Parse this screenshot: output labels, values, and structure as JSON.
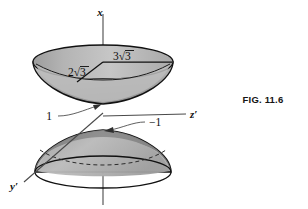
{
  "figure": {
    "caption": "FIG. 11.6",
    "axes": {
      "x_label": "x",
      "z_prime_label": "z′",
      "y_prime_label": "y′"
    },
    "measurements": {
      "upper_minor_radius": {
        "coefficient": "2",
        "radical": "√",
        "radicand": "3"
      },
      "upper_major_radius": {
        "coefficient": "3",
        "radical": "√",
        "radicand": "3"
      }
    },
    "vertex_labels": {
      "upper_cone_vertex": "1",
      "lower_cone_vertex": "−1"
    },
    "colors": {
      "surface_fill": "#b3b3b3",
      "surface_fill_light": "#c8c8c8",
      "surface_fill_dark": "#8e8e8e",
      "outline": "#111111",
      "axis": "#4a4a4a",
      "background": "#ffffff"
    },
    "description": {
      "shape": "double-napped cone (two cones apex-to-apex) along the x-axis",
      "upper_nappe": "opens upward, vertex at x = 1",
      "lower_nappe": "opens downward, vertex at x = −1"
    }
  }
}
